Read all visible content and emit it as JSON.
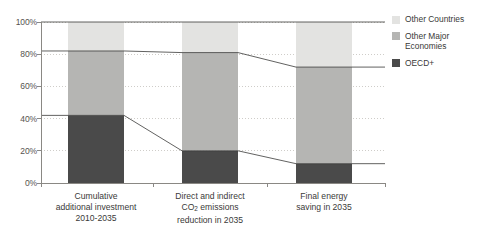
{
  "chart_data": {
    "type": "bar",
    "stacked": true,
    "stack_mode": "percent",
    "title": "",
    "xlabel": "",
    "ylabel": "",
    "ylim": [
      0,
      100
    ],
    "yticks": [
      0,
      20,
      40,
      60,
      80,
      100
    ],
    "ytick_labels": [
      "0%",
      "20%",
      "40%",
      "60%",
      "80%",
      "100%"
    ],
    "grid": true,
    "grid_style": "dotted",
    "legend_position": "right",
    "categories": [
      "Cumulative additional investment 2010-2035",
      "Direct and indirect CO2 emissions reduction in 2035",
      "Final energy saving in 2035"
    ],
    "category_label_lines": [
      [
        "Cumulative",
        "additional investment",
        "2010-2035"
      ],
      [
        "Direct and indirect",
        "CO~2~ emissions",
        "reduction in 2035"
      ],
      [
        "Final energy",
        "saving in 2035"
      ]
    ],
    "series": [
      {
        "name": "OECD+",
        "color": "#4a4a4a",
        "values": [
          42,
          20,
          12
        ]
      },
      {
        "name": "Other Major Economies",
        "color": "#b5b5b3",
        "values": [
          40,
          61,
          60
        ]
      },
      {
        "name": "Other Countries",
        "color": "#e3e3e1",
        "values": [
          18,
          19,
          28
        ]
      }
    ],
    "cumulative_boundaries": [
      {
        "level": "OECD+ top",
        "values": [
          42,
          20,
          12
        ]
      },
      {
        "level": "Other Major Economies top",
        "values": [
          82,
          81,
          72
        ]
      },
      {
        "level": "Other Countries top",
        "values": [
          100,
          100,
          100
        ]
      }
    ],
    "connector_lines": true,
    "connector_color": "#3a3a38"
  },
  "legend": {
    "items": [
      {
        "label": "Other Countries",
        "color": "#e3e3e1"
      },
      {
        "label": "Other Major Economies",
        "color": "#b5b5b3"
      },
      {
        "label": "OECD+",
        "color": "#4a4a4a"
      }
    ]
  },
  "axis": {
    "y_labels": [
      "100%",
      "80%",
      "60%",
      "40%",
      "20%",
      "0%"
    ]
  },
  "colors": {
    "oecd": "#4a4a4a",
    "major": "#b5b5b3",
    "other": "#e3e3e1",
    "axis": "#8a8884",
    "grid": "#cfcdc9",
    "text": "#3a3a38"
  }
}
